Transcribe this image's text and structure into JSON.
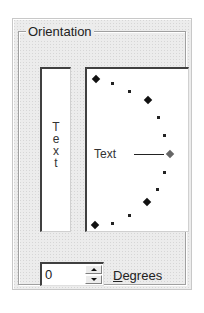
{
  "orientation": {
    "group_label": "Orientation",
    "vertical_text": {
      "letters": [
        "T",
        "e",
        "x",
        "t"
      ]
    },
    "dial": {
      "label": "Text",
      "selected_angle": 0,
      "active_color": "#666666"
    },
    "degrees": {
      "value": "0",
      "label_mnemonic": "D",
      "label_rest": "egrees",
      "label_full": "Degrees"
    },
    "icons": {
      "spin_up": "triangle-up-icon",
      "spin_down": "triangle-down-icon",
      "dial_marker": "diamond-icon"
    }
  }
}
